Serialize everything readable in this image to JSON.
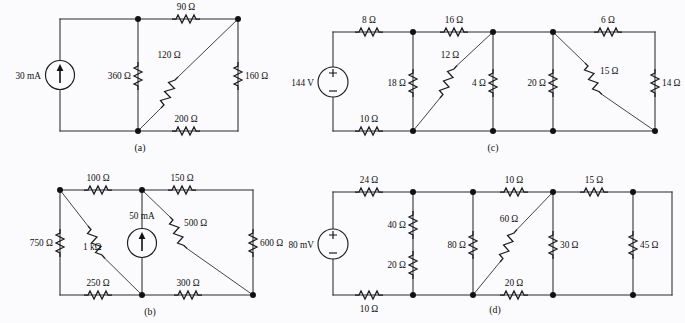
{
  "figure": {
    "background_color": "#fbfbfd",
    "line_color": "#2b2b2b",
    "subfigures": [
      {
        "id": "a",
        "caption": "(a)",
        "source": {
          "label": "30 mA",
          "type": "current-source",
          "direction": "up"
        },
        "components": [
          {
            "name": "r-360",
            "label": "360 Ω",
            "orientation": "vertical"
          },
          {
            "name": "r-90",
            "label": "90 Ω",
            "orientation": "horizontal"
          },
          {
            "name": "r-120",
            "label": "120 Ω",
            "orientation": "diagonal"
          },
          {
            "name": "r-160",
            "label": "160 Ω",
            "orientation": "vertical"
          },
          {
            "name": "r-200",
            "label": "200 Ω",
            "orientation": "horizontal"
          }
        ]
      },
      {
        "id": "b",
        "caption": "(b)",
        "source": {
          "label": "50 mA",
          "type": "current-source",
          "direction": "up"
        },
        "components": [
          {
            "name": "r-750",
            "label": "750 Ω",
            "orientation": "vertical"
          },
          {
            "name": "r-100",
            "label": "100 Ω",
            "orientation": "horizontal"
          },
          {
            "name": "r-1k",
            "label": "1 kΩ",
            "orientation": "diagonal"
          },
          {
            "name": "r-150",
            "label": "150 Ω",
            "orientation": "horizontal"
          },
          {
            "name": "r-500",
            "label": "500 Ω",
            "orientation": "diagonal"
          },
          {
            "name": "r-600",
            "label": "600 Ω",
            "orientation": "vertical"
          },
          {
            "name": "r-250",
            "label": "250 Ω",
            "orientation": "horizontal"
          },
          {
            "name": "r-300",
            "label": "300 Ω",
            "orientation": "horizontal"
          }
        ]
      },
      {
        "id": "c",
        "caption": "(c)",
        "source": {
          "label": "144 V",
          "type": "voltage-source",
          "plus": "+",
          "minus": "−"
        },
        "components": [
          {
            "name": "r-8",
            "label": "8 Ω",
            "orientation": "horizontal"
          },
          {
            "name": "r-16",
            "label": "16 Ω",
            "orientation": "horizontal"
          },
          {
            "name": "r-6",
            "label": "6 Ω",
            "orientation": "horizontal"
          },
          {
            "name": "r-18",
            "label": "18 Ω",
            "orientation": "vertical"
          },
          {
            "name": "r-12",
            "label": "12 Ω",
            "orientation": "diagonal"
          },
          {
            "name": "r-4",
            "label": "4 Ω",
            "orientation": "vertical"
          },
          {
            "name": "r-20",
            "label": "20 Ω",
            "orientation": "vertical"
          },
          {
            "name": "r-15",
            "label": "15 Ω",
            "orientation": "diagonal"
          },
          {
            "name": "r-14",
            "label": "14 Ω",
            "orientation": "vertical"
          },
          {
            "name": "r-10",
            "label": "10 Ω",
            "orientation": "horizontal"
          }
        ]
      },
      {
        "id": "d",
        "caption": "(d)",
        "source": {
          "label": "80 mV",
          "type": "voltage-source",
          "plus": "+",
          "minus": "−"
        },
        "components": [
          {
            "name": "r-24",
            "label": "24 Ω",
            "orientation": "horizontal"
          },
          {
            "name": "r-40",
            "label": "40 Ω",
            "orientation": "vertical"
          },
          {
            "name": "r-20-left",
            "label": "20 Ω",
            "orientation": "vertical"
          },
          {
            "name": "r-80",
            "label": "80 Ω",
            "orientation": "vertical"
          },
          {
            "name": "r-10-top",
            "label": "10 Ω",
            "orientation": "horizontal"
          },
          {
            "name": "r-60",
            "label": "60 Ω",
            "orientation": "diagonal"
          },
          {
            "name": "r-30",
            "label": "30 Ω",
            "orientation": "vertical"
          },
          {
            "name": "r-15",
            "label": "15 Ω",
            "orientation": "horizontal"
          },
          {
            "name": "r-45",
            "label": "45 Ω",
            "orientation": "vertical"
          },
          {
            "name": "r-20-bottom",
            "label": "20 Ω",
            "orientation": "horizontal"
          },
          {
            "name": "r-10-bottom",
            "label": "10 Ω",
            "orientation": "horizontal"
          }
        ]
      }
    ]
  },
  "labels": {
    "a": {
      "src": "30 mA",
      "r360": "360 Ω",
      "r90": "90 Ω",
      "r120": "120 Ω",
      "r160": "160 Ω",
      "r200": "200 Ω",
      "caption": "(a)"
    },
    "b": {
      "src": "50 mA",
      "r750": "750 Ω",
      "r100": "100 Ω",
      "r1k": "1 kΩ",
      "r150": "150 Ω",
      "r500": "500 Ω",
      "r600": "600 Ω",
      "r250": "250 Ω",
      "r300": "300 Ω",
      "caption": "(b)"
    },
    "c": {
      "src": "144 V",
      "plus": "+",
      "minus": "−",
      "r8": "8 Ω",
      "r16": "16 Ω",
      "r6": "6 Ω",
      "r18": "18 Ω",
      "r12": "12 Ω",
      "r4": "4 Ω",
      "r20": "20 Ω",
      "r15": "15 Ω",
      "r14": "14 Ω",
      "r10": "10 Ω",
      "caption": "(c)"
    },
    "d": {
      "src": "80 mV",
      "plus": "+",
      "minus": "−",
      "r24": "24 Ω",
      "r40": "40 Ω",
      "r20l": "20 Ω",
      "r80": "80 Ω",
      "r10t": "10 Ω",
      "r60": "60 Ω",
      "r30": "30 Ω",
      "r15": "15 Ω",
      "r45": "45 Ω",
      "r20b": "20 Ω",
      "r10b": "10 Ω",
      "caption": "(d)"
    }
  }
}
